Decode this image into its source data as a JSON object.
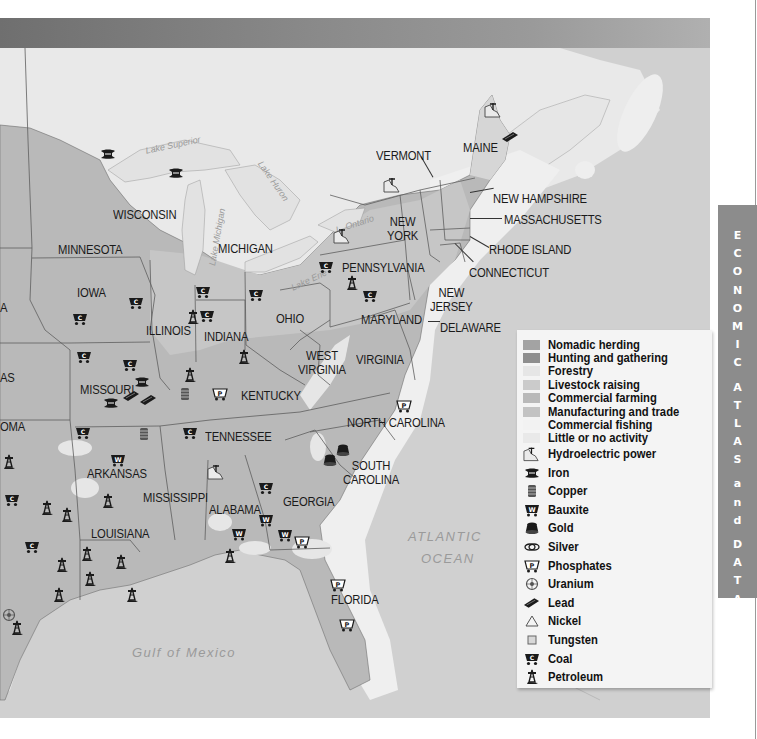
{
  "side_tab": {
    "title": "ECONOMIC ATLAS and DATABANK",
    "letters": [
      "E",
      "C",
      "O",
      "N",
      "O",
      "M",
      "I",
      "C",
      " ",
      "A",
      "T",
      "L",
      "A",
      "S",
      " ",
      "a",
      "n",
      "d",
      " ",
      "D",
      "A",
      "T",
      "A",
      "B",
      "A",
      "N",
      "K"
    ]
  },
  "map": {
    "states": [
      {
        "name": "MINNESOTA",
        "x": 58,
        "y": 243
      },
      {
        "name": "WISCONSIN",
        "x": 113,
        "y": 208
      },
      {
        "name": "MICHIGAN",
        "x": 218,
        "y": 242
      },
      {
        "name": "IOWA",
        "x": 77,
        "y": 286
      },
      {
        "name": "ILLINOIS",
        "x": 146,
        "y": 324
      },
      {
        "name": "INDIANA",
        "x": 204,
        "y": 330
      },
      {
        "name": "OHIO",
        "x": 276,
        "y": 312
      },
      {
        "name": "PENNSYLVANIA",
        "x": 342,
        "y": 261
      },
      {
        "name": "NEW YORK",
        "x": 387,
        "y": 215,
        "line2": "YORK",
        "line1": "NEW"
      },
      {
        "name": "VERMONT",
        "x": 376,
        "y": 149
      },
      {
        "name": "MAINE",
        "x": 463,
        "y": 141
      },
      {
        "name": "NEW HAMPSHIRE",
        "x": 493,
        "y": 192
      },
      {
        "name": "MASSACHUSETTS",
        "x": 504,
        "y": 213
      },
      {
        "name": "RHODE ISLAND",
        "x": 489,
        "y": 243
      },
      {
        "name": "CONNECTICUT",
        "x": 469,
        "y": 266
      },
      {
        "name": "NEW JERSEY",
        "x": 430,
        "y": 286,
        "line1": "NEW",
        "line2": "JERSEY"
      },
      {
        "name": "MARYLAND",
        "x": 361,
        "y": 313
      },
      {
        "name": "DELAWARE",
        "x": 440,
        "y": 321
      },
      {
        "name": "WEST VIRGINIA",
        "x": 298,
        "y": 349,
        "line1": "WEST",
        "line2": "VIRGINIA"
      },
      {
        "name": "VIRGINIA",
        "x": 356,
        "y": 353
      },
      {
        "name": "KENTUCKY",
        "x": 241,
        "y": 389
      },
      {
        "name": "MISSOURI",
        "x": 80,
        "y": 383
      },
      {
        "name": "TENNESSEE",
        "x": 205,
        "y": 430
      },
      {
        "name": "NORTH CAROLINA",
        "x": 347,
        "y": 416
      },
      {
        "name": "SOUTH CAROLINA",
        "x": 343,
        "y": 459,
        "line1": "SOUTH",
        "line2": "CAROLINA"
      },
      {
        "name": "ARKANSAS",
        "x": 87,
        "y": 467
      },
      {
        "name": "MISSISSIPPI",
        "x": 143,
        "y": 491
      },
      {
        "name": "ALABAMA",
        "x": 209,
        "y": 503
      },
      {
        "name": "GEORGIA",
        "x": 283,
        "y": 495
      },
      {
        "name": "LOUISIANA",
        "x": 91,
        "y": 527
      },
      {
        "name": "FLORIDA",
        "x": 331,
        "y": 593
      }
    ],
    "partial_labels": [
      {
        "text": "A",
        "x": 0,
        "y": 301
      },
      {
        "text": "AS",
        "x": 0,
        "y": 371
      },
      {
        "text": "OMA",
        "x": 0,
        "y": 420
      }
    ],
    "water_bodies": [
      {
        "name": "ATLANTIC",
        "x": 408,
        "y": 529
      },
      {
        "name": "OCEAN",
        "x": 421,
        "y": 551
      },
      {
        "name": "Gulf of Mexico",
        "x": 132,
        "y": 645
      }
    ],
    "lakes": [
      {
        "name": "Lake Superior",
        "x": 145,
        "y": 140
      },
      {
        "name": "Lake Michigan",
        "x": 188,
        "y": 232
      },
      {
        "name": "Lake Huron",
        "x": 250,
        "y": 176
      },
      {
        "name": "L. Ontario",
        "x": 335,
        "y": 219
      },
      {
        "name": "Lake Erie",
        "x": 290,
        "y": 275
      }
    ],
    "resource_icons": [
      {
        "type": "iron",
        "x": 100,
        "y": 148
      },
      {
        "type": "iron",
        "x": 168,
        "y": 167
      },
      {
        "type": "coal",
        "x": 128,
        "y": 296
      },
      {
        "type": "coal",
        "x": 72,
        "y": 312
      },
      {
        "type": "coal",
        "x": 76,
        "y": 350
      },
      {
        "type": "coal",
        "x": 122,
        "y": 358
      },
      {
        "type": "coal",
        "x": 195,
        "y": 285
      },
      {
        "type": "coal",
        "x": 199,
        "y": 309
      },
      {
        "type": "coal",
        "x": 318,
        "y": 260
      },
      {
        "type": "coal",
        "x": 362,
        "y": 289
      },
      {
        "type": "coal",
        "x": 248,
        "y": 288
      },
      {
        "type": "coal",
        "x": 75,
        "y": 426
      },
      {
        "type": "coal",
        "x": 182,
        "y": 426
      },
      {
        "type": "coal",
        "x": 258,
        "y": 481
      },
      {
        "type": "coal",
        "x": 4,
        "y": 493
      },
      {
        "type": "coal",
        "x": 24,
        "y": 540
      },
      {
        "type": "iron",
        "x": 134,
        "y": 376
      },
      {
        "type": "iron",
        "x": 103,
        "y": 397
      },
      {
        "type": "lead",
        "x": 122,
        "y": 390
      },
      {
        "type": "lead",
        "x": 139,
        "y": 394
      },
      {
        "type": "copper",
        "x": 179,
        "y": 387
      },
      {
        "type": "copper",
        "x": 138,
        "y": 427
      },
      {
        "type": "petroleum",
        "x": 183,
        "y": 367
      },
      {
        "type": "petroleum",
        "x": 237,
        "y": 349
      },
      {
        "type": "petroleum",
        "x": 186,
        "y": 309
      },
      {
        "type": "petroleum",
        "x": 345,
        "y": 275
      },
      {
        "type": "petroleum",
        "x": 101,
        "y": 493
      },
      {
        "type": "petroleum",
        "x": 40,
        "y": 500
      },
      {
        "type": "petroleum",
        "x": 60,
        "y": 507
      },
      {
        "type": "petroleum",
        "x": 2,
        "y": 454
      },
      {
        "type": "petroleum",
        "x": 80,
        "y": 546
      },
      {
        "type": "petroleum",
        "x": 114,
        "y": 554
      },
      {
        "type": "petroleum",
        "x": 55,
        "y": 557
      },
      {
        "type": "petroleum",
        "x": 83,
        "y": 571
      },
      {
        "type": "petroleum",
        "x": 125,
        "y": 587
      },
      {
        "type": "petroleum",
        "x": 52,
        "y": 587
      },
      {
        "type": "petroleum",
        "x": 10,
        "y": 620
      },
      {
        "type": "petroleum",
        "x": 223,
        "y": 548
      },
      {
        "type": "bauxite",
        "x": 110,
        "y": 453
      },
      {
        "type": "bauxite",
        "x": 258,
        "y": 513
      },
      {
        "type": "bauxite",
        "x": 231,
        "y": 527
      },
      {
        "type": "bauxite",
        "x": 277,
        "y": 528
      },
      {
        "type": "phosphates",
        "x": 212,
        "y": 387
      },
      {
        "type": "phosphates",
        "x": 396,
        "y": 399
      },
      {
        "type": "phosphates",
        "x": 294,
        "y": 535
      },
      {
        "type": "phosphates",
        "x": 330,
        "y": 578
      },
      {
        "type": "phosphates",
        "x": 339,
        "y": 618
      },
      {
        "type": "gold",
        "x": 335,
        "y": 443
      },
      {
        "type": "gold",
        "x": 322,
        "y": 453
      },
      {
        "type": "hydro",
        "x": 207,
        "y": 464
      },
      {
        "type": "hydro",
        "x": 383,
        "y": 177
      },
      {
        "type": "hydro",
        "x": 333,
        "y": 228
      },
      {
        "type": "hydro",
        "x": 484,
        "y": 102
      },
      {
        "type": "lead",
        "x": 501,
        "y": 131
      },
      {
        "type": "uranium",
        "x": 2,
        "y": 608
      }
    ]
  },
  "legend": {
    "land_use": [
      {
        "label": "Nomadic herding",
        "color": "#a3a3a3"
      },
      {
        "label": "Hunting and gathering",
        "color": "#8e8e8e"
      },
      {
        "label": "Forestry",
        "color": "#e6e6e6"
      },
      {
        "label": "Livestock raising",
        "color": "#cbcbcb"
      },
      {
        "label": "Commercial farming",
        "color": "#b9b9b9"
      },
      {
        "label": "Manufacturing and trade",
        "color": "#c3c3c3"
      },
      {
        "label": "Commercial fishing",
        "color": "#f2f2f2"
      },
      {
        "label": "Little or no activity",
        "color": "#e9e9e9"
      }
    ],
    "resources": [
      {
        "label": "Hydroelectric power",
        "icon": "hydro"
      },
      {
        "label": "Iron",
        "icon": "iron"
      },
      {
        "label": "Copper",
        "icon": "copper"
      },
      {
        "label": "Bauxite",
        "icon": "bauxite"
      },
      {
        "label": "Gold",
        "icon": "gold"
      },
      {
        "label": "Silver",
        "icon": "silver"
      },
      {
        "label": "Phosphates",
        "icon": "phosphates"
      },
      {
        "label": "Uranium",
        "icon": "uranium"
      },
      {
        "label": "Lead",
        "icon": "lead"
      },
      {
        "label": "Nickel",
        "icon": "nickel"
      },
      {
        "label": "Tungsten",
        "icon": "tungsten"
      },
      {
        "label": "Coal",
        "icon": "coal"
      },
      {
        "label": "Petroleum",
        "icon": "petroleum"
      }
    ]
  },
  "colors": {
    "header_dark": "#6f6f6f",
    "header_light": "#b0b0b0",
    "side_tab": "#8c8c8c",
    "ocean": "#d0d0d0",
    "coast_fishing": "#efefef",
    "land_farming": "#b9b9b9",
    "land_manufacturing": "#c3c3c3",
    "canada": "#e9e9e9"
  }
}
